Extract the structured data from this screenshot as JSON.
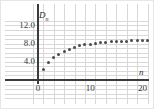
{
  "figure": {
    "name": "sequence-scatter-plot"
  },
  "chart_data": {
    "type": "scatter",
    "title": "",
    "subtitle": "",
    "xlabel": "n",
    "ylabel": "D_n",
    "ylabel_display": "D",
    "ylabel_sub": "n",
    "xlim": [
      -1,
      22
    ],
    "ylim": [
      0,
      13.2
    ],
    "grid": true,
    "grid_x_step": 2,
    "grid_y_step": 1,
    "legend": null,
    "x_ticks": [
      0,
      10,
      20
    ],
    "x_tick_labels": [
      "0",
      "10",
      "20"
    ],
    "y_ticks": [
      4.0,
      8.0,
      12.0
    ],
    "y_tick_labels": [
      "4.0",
      "8.0",
      "12.0"
    ],
    "marker": "filled-circle",
    "marker_color": "#4a4a52",
    "axis_color": "#3b3b3b",
    "grid_color": "#d8d8d8",
    "x": [
      1,
      2,
      3,
      4,
      5,
      6,
      7,
      8,
      9,
      10,
      11,
      12,
      13,
      14,
      15,
      16,
      17,
      18,
      19,
      20,
      21
    ],
    "y": [
      2.3,
      3.8,
      4.9,
      5.7,
      6.3,
      6.8,
      7.2,
      7.5,
      7.7,
      7.9,
      8.05,
      8.2,
      8.3,
      8.4,
      8.45,
      8.5,
      8.55,
      8.6,
      8.62,
      8.65,
      8.68
    ]
  }
}
